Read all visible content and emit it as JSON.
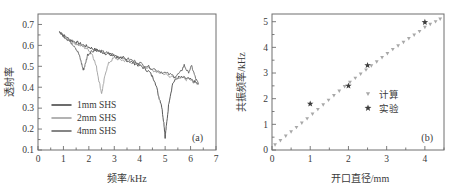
{
  "figure": {
    "panels": [
      {
        "tag": "(a)",
        "xlabel": "频率/kHz",
        "ylabel": "透射率",
        "xticks": [
          "0",
          "1",
          "2",
          "3",
          "4",
          "5",
          "6",
          "7"
        ],
        "yticks": [
          "0.1",
          "0.2",
          "0.3",
          "0.4",
          "0.5",
          "0.6",
          "0.7"
        ],
        "legend": [
          {
            "label": "1mm SHS",
            "color": "#3d3d3d"
          },
          {
            "label": "2mm SHS",
            "color": "#9a9a9a"
          },
          {
            "label": "4mm SHS",
            "color": "#5e5e5e"
          }
        ]
      },
      {
        "tag": "(b)",
        "xlabel": "开口直径/mm",
        "ylabel": "共振频率/kHz",
        "xticks": [
          "0",
          "1",
          "2",
          "3",
          "4"
        ],
        "yticks": [
          "0",
          "1",
          "2",
          "3",
          "4",
          "5"
        ],
        "legend": [
          {
            "label": "计算",
            "marker": "triangle-down-marker",
            "color": "#a8a8a8"
          },
          {
            "label": "实验",
            "marker": "star-marker",
            "color": "#3d3d3d"
          }
        ]
      }
    ]
  },
  "chart_data": [
    {
      "type": "line",
      "title": "",
      "panel": "(a)",
      "xlabel": "频率/kHz",
      "ylabel": "透射率",
      "xlim": [
        0,
        7
      ],
      "ylim": [
        0.1,
        0.75
      ],
      "xticks": [
        0,
        1,
        2,
        3,
        4,
        5,
        6,
        7
      ],
      "yticks": [
        0.1,
        0.2,
        0.3,
        0.4,
        0.5,
        0.6,
        0.7
      ],
      "grid": false,
      "legend_position": "lower-left",
      "series": [
        {
          "name": "1mm SHS",
          "color": "#3d3d3d",
          "resonance_dip_khz": 5.0,
          "dip_depth": 0.16,
          "x": [
            0.85,
            1.0,
            1.2,
            1.4,
            1.6,
            1.8,
            2.0,
            2.2,
            2.4,
            2.6,
            2.8,
            3.0,
            3.2,
            3.4,
            3.6,
            3.8,
            4.0,
            4.2,
            4.4,
            4.6,
            4.75,
            4.85,
            4.95,
            5.0,
            5.05,
            5.15,
            5.3,
            5.5,
            5.7,
            5.9,
            6.1,
            6.3
          ],
          "y": [
            0.665,
            0.648,
            0.632,
            0.62,
            0.61,
            0.6,
            0.592,
            0.582,
            0.573,
            0.565,
            0.556,
            0.548,
            0.54,
            0.532,
            0.524,
            0.514,
            0.503,
            0.49,
            0.47,
            0.43,
            0.355,
            0.32,
            0.23,
            0.163,
            0.215,
            0.33,
            0.42,
            0.447,
            0.445,
            0.44,
            0.43,
            0.415
          ]
        },
        {
          "name": "2mm SHS",
          "color": "#9a9a9a",
          "resonance_dip_khz": 2.5,
          "dip_depth": 0.37,
          "x": [
            0.85,
            1.0,
            1.2,
            1.4,
            1.6,
            1.8,
            2.0,
            2.15,
            2.3,
            2.4,
            2.5,
            2.55,
            2.65,
            2.8,
            3.0,
            3.2,
            3.4,
            3.6,
            3.8,
            4.0,
            4.3,
            4.6,
            4.9,
            5.2,
            5.5,
            5.8,
            6.0,
            6.3
          ],
          "y": [
            0.66,
            0.645,
            0.628,
            0.614,
            0.602,
            0.592,
            0.578,
            0.555,
            0.495,
            0.43,
            0.372,
            0.395,
            0.47,
            0.52,
            0.54,
            0.533,
            0.528,
            0.522,
            0.515,
            0.506,
            0.492,
            0.478,
            0.466,
            0.455,
            0.447,
            0.44,
            0.432,
            0.418
          ]
        },
        {
          "name": "4mm SHS",
          "color": "#5e5e5e",
          "resonance_dip_khz": 1.8,
          "dip_depth": 0.48,
          "x": [
            0.85,
            1.0,
            1.15,
            1.3,
            1.45,
            1.6,
            1.7,
            1.78,
            1.85,
            1.95,
            2.1,
            2.3,
            2.5,
            2.7,
            2.9,
            3.1,
            3.3,
            3.6,
            3.9,
            4.2,
            4.5,
            4.8,
            5.1,
            5.4,
            5.6,
            5.75,
            5.9,
            6.05,
            6.2,
            6.3
          ],
          "y": [
            0.662,
            0.646,
            0.63,
            0.614,
            0.596,
            0.56,
            0.52,
            0.482,
            0.505,
            0.555,
            0.572,
            0.578,
            0.57,
            0.564,
            0.558,
            0.55,
            0.543,
            0.532,
            0.52,
            0.505,
            0.49,
            0.476,
            0.464,
            0.452,
            0.47,
            0.505,
            0.47,
            0.5,
            0.44,
            0.418
          ]
        }
      ]
    },
    {
      "type": "scatter",
      "title": "",
      "panel": "(b)",
      "xlabel": "开口直径/mm",
      "ylabel": "共振频率/kHz",
      "xlim": [
        0,
        4.5
      ],
      "ylim": [
        0,
        5.3
      ],
      "xticks": [
        0,
        1,
        2,
        3,
        4
      ],
      "yticks": [
        0,
        1,
        2,
        3,
        4,
        5
      ],
      "grid": false,
      "legend_position": "center-right",
      "series": [
        {
          "name": "计算",
          "marker": "triangle-down-marker",
          "color": "#a8a8a8",
          "x": [
            0.08,
            0.22,
            0.36,
            0.5,
            0.64,
            0.78,
            0.92,
            1.06,
            1.2,
            1.34,
            1.48,
            1.62,
            1.76,
            1.9,
            2.04,
            2.18,
            2.32,
            2.46,
            2.6,
            2.74,
            2.88,
            3.02,
            3.16,
            3.3,
            3.44,
            3.58,
            3.72,
            3.86,
            4.0,
            4.14,
            4.28,
            4.4
          ],
          "y": [
            0.2,
            0.37,
            0.54,
            0.71,
            0.88,
            1.05,
            1.22,
            1.4,
            1.58,
            1.76,
            1.94,
            2.12,
            2.3,
            2.47,
            2.64,
            2.8,
            2.96,
            3.12,
            3.28,
            3.44,
            3.6,
            3.76,
            3.92,
            4.06,
            4.2,
            4.34,
            4.48,
            4.62,
            4.78,
            4.9,
            5.0,
            5.1
          ]
        },
        {
          "name": "实验",
          "marker": "star-marker",
          "color": "#3d3d3d",
          "x": [
            1.0,
            2.0,
            2.5,
            4.0
          ],
          "y": [
            1.8,
            2.5,
            3.3,
            4.98
          ]
        }
      ]
    }
  ]
}
